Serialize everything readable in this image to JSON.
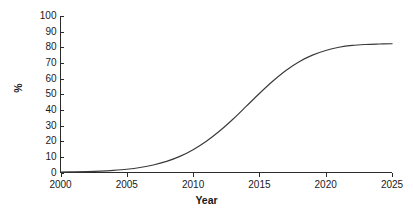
{
  "chart_data": {
    "type": "line",
    "title": "",
    "subtitle": "",
    "xlabel": "Year",
    "ylabel": "%",
    "xlim": [
      2000,
      2025
    ],
    "ylim": [
      0,
      100
    ],
    "xticks": [
      2000,
      2005,
      2010,
      2015,
      2020,
      2025
    ],
    "xtick_labels": [
      "2000",
      "2005",
      "2010",
      "2015",
      "2020",
      "2025"
    ],
    "yticks": [
      0,
      10,
      20,
      30,
      40,
      50,
      60,
      70,
      80,
      90,
      100
    ],
    "ytick_labels": [
      "0",
      "10",
      "20",
      "30",
      "40",
      "50",
      "60",
      "70",
      "80",
      "90",
      "100"
    ],
    "grid": false,
    "legend": false,
    "legend_position": "none",
    "line_color": "#3a3a3a",
    "axis_color": "#2b2b2b",
    "background_color": "#ffffff",
    "series": [
      {
        "name": "adoption",
        "x": [
          2000,
          2001,
          2002,
          2003,
          2004,
          2005,
          2006,
          2007,
          2008,
          2009,
          2010,
          2011,
          2012,
          2013,
          2014,
          2015,
          2016,
          2017,
          2018,
          2019,
          2020,
          2021,
          2022,
          2023,
          2024,
          2025
        ],
        "values": [
          0.3,
          0.4,
          0.6,
          0.9,
          1.4,
          2.1,
          3.2,
          4.8,
          7.1,
          10.3,
          14.6,
          20.0,
          26.5,
          34.0,
          42.2,
          50.5,
          58.3,
          65.2,
          70.8,
          75.0,
          78.0,
          80.0,
          81.2,
          81.8,
          82.1,
          82.3
        ]
      }
    ]
  }
}
